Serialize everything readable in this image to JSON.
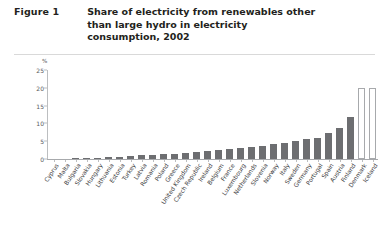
{
  "header": {
    "figure_label": "Figure 1",
    "title": "Share of electricity from renewables other than large hydro in electricity consumption, 2002"
  },
  "chart_data": {
    "type": "bar",
    "title": "Share of electricity from renewables other than large hydro in electricity consumption, 2002",
    "xlabel": "",
    "ylabel": "%",
    "ylim": [
      0,
      25
    ],
    "yticks": [
      0,
      5,
      10,
      15,
      20,
      25
    ],
    "grid": false,
    "legend": "none",
    "bar_color": "#6d6e71",
    "highlight_bar_color": "#ffffff",
    "highlight_bar_border": "#a7a9ac",
    "categories": [
      "Cyprus",
      "Malta",
      "Bulgaria",
      "Slovakia",
      "Hungary",
      "Lithuania",
      "Estonia",
      "Turkey",
      "Latvia",
      "Romania",
      "Poland",
      "Greece",
      "United Kingdom",
      "Czech Republic",
      "Ireland",
      "Belgium",
      "France",
      "Luxembourg",
      "Netherlands",
      "Slovenia",
      "Norway",
      "Italy",
      "Sweden",
      "Germany",
      "Portugal",
      "Spain",
      "Austria",
      "Finland",
      "Denmark",
      "Iceland"
    ],
    "values": [
      0.0,
      0.0,
      0.2,
      0.3,
      0.4,
      0.5,
      0.6,
      0.8,
      1.0,
      1.1,
      1.3,
      1.5,
      1.7,
      2.0,
      2.2,
      2.6,
      2.8,
      3.0,
      3.4,
      3.7,
      4.2,
      4.6,
      5.2,
      5.6,
      6.0,
      7.3,
      8.6,
      11.8,
      20.0,
      20.0
    ],
    "highlighted": [
      "Denmark",
      "Iceland"
    ]
  }
}
